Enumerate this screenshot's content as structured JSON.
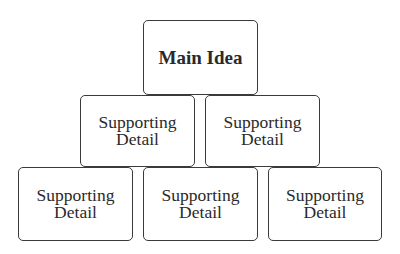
{
  "diagram": {
    "type": "pyramid",
    "border_color": "#3a3a3a",
    "text_color": "#2a2a2a",
    "rows": [
      {
        "level": 1,
        "boxes": [
          {
            "lines": [
              "Main Idea"
            ],
            "bold": true
          }
        ]
      },
      {
        "level": 2,
        "boxes": [
          {
            "lines": [
              "Supporting",
              "Detail"
            ]
          },
          {
            "lines": [
              "Supporting",
              "Detail"
            ]
          }
        ]
      },
      {
        "level": 3,
        "boxes": [
          {
            "lines": [
              "Supporting",
              "Detail"
            ]
          },
          {
            "lines": [
              "Supporting",
              "Detail"
            ]
          },
          {
            "lines": [
              "Supporting",
              "Detail"
            ]
          }
        ]
      }
    ]
  }
}
